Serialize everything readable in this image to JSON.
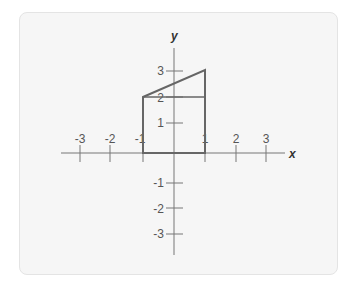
{
  "diagram": {
    "type": "coordinate-plane-figure",
    "axes": {
      "x_label": "x",
      "y_label": "y",
      "x_ticks": [
        {
          "value": -3,
          "label": "-3"
        },
        {
          "value": -2,
          "label": "-2"
        },
        {
          "value": -1,
          "label": "-1"
        },
        {
          "value": 1,
          "label": "1"
        },
        {
          "value": 2,
          "label": "2"
        },
        {
          "value": 3,
          "label": "3"
        }
      ],
      "y_ticks": [
        {
          "value": 3,
          "label": "3"
        },
        {
          "value": 2,
          "label": "2"
        },
        {
          "value": 1,
          "label": "1"
        },
        {
          "value": -1,
          "label": "-1"
        },
        {
          "value": -2,
          "label": "-2"
        },
        {
          "value": -3,
          "label": "-3"
        }
      ]
    },
    "figure": {
      "vertices": [
        [
          -1,
          0
        ],
        [
          1,
          0
        ],
        [
          1,
          3
        ],
        [
          -1,
          2
        ]
      ],
      "inner_segment": [
        [
          -1,
          2
        ],
        [
          1,
          2
        ]
      ],
      "stroke_color": "#666666"
    },
    "colors": {
      "background": "#f6f6f6",
      "axis": "#777777",
      "text": "#555555"
    }
  }
}
